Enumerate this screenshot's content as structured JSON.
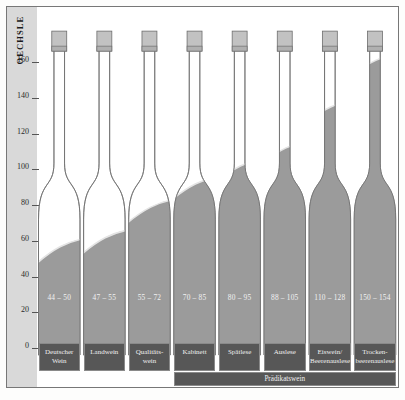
{
  "chart_data": {
    "type": "bar",
    "title": "",
    "ylabel": "OECHSLE",
    "xlabel": "",
    "ylim": [
      0,
      170
    ],
    "yticks": [
      0,
      20,
      40,
      60,
      80,
      100,
      120,
      140,
      160
    ],
    "grid": false,
    "legend": "none",
    "categories": [
      "Deutscher Wein",
      "Landwein",
      "Qualitäts-\nwein",
      "Kabinett",
      "Spätlese",
      "Auslese",
      "Eiswein/\nBeerenauslese",
      "Trocken-\nbeerenauslese"
    ],
    "range_labels": [
      "44 – 50",
      "47 – 55",
      "55 – 72",
      "70 – 85",
      "80 – 95",
      "88 – 105",
      "110 – 128",
      "150 – 154"
    ],
    "values_min": [
      44,
      47,
      55,
      70,
      80,
      88,
      110,
      150
    ],
    "values_max": [
      50,
      55,
      72,
      85,
      95,
      105,
      128,
      154
    ],
    "group_label": "Prädikatswein",
    "group_span": [
      3,
      7
    ],
    "colors": {
      "fill": "#9b9b9b",
      "bottle_outline": "#6e6e6e",
      "label_box": "#575757",
      "axis_band": "#d9d9d9",
      "background": "#ffffff"
    }
  },
  "axis": {
    "title": "OECHSLE",
    "ticks": [
      "160",
      "140",
      "120",
      "100",
      "80",
      "60",
      "40",
      "20",
      "0"
    ]
  },
  "bottles": [
    {
      "range": "44 – 50",
      "category_line1": "Deutscher",
      "category_line2": "Wein"
    },
    {
      "range": "47 – 55",
      "category_line1": "Landwein",
      "category_line2": ""
    },
    {
      "range": "55 – 72",
      "category_line1": "Qualitäts-",
      "category_line2": "wein"
    },
    {
      "range": "70 – 85",
      "category_line1": "Kabinett",
      "category_line2": ""
    },
    {
      "range": "80 – 95",
      "category_line1": "Spätlese",
      "category_line2": ""
    },
    {
      "range": "88 – 105",
      "category_line1": "Auslese",
      "category_line2": ""
    },
    {
      "range": "110 – 128",
      "category_line1": "Eiswein/",
      "category_line2": "Beerenauslese"
    },
    {
      "range": "150 – 154",
      "category_line1": "Trocken-",
      "category_line2": "beerenauslese"
    }
  ],
  "group": {
    "label": "Prädikatswein"
  }
}
